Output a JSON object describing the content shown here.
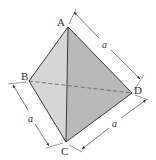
{
  "diagram": {
    "colors": {
      "background": "#ffffff",
      "edge": "#3a3a3a",
      "face_front_left": "#d6d6d6",
      "face_front_right": "#b9b9b9",
      "hidden_edge": "#6a6a6a",
      "dimension_line": "#444444"
    },
    "vertices": {
      "A": {
        "label": "A",
        "x": 68,
        "y": 27
      },
      "B": {
        "label": "B",
        "x": 29,
        "y": 81
      },
      "C": {
        "label": "C",
        "x": 66,
        "y": 142
      },
      "D": {
        "label": "D",
        "x": 132,
        "y": 93
      }
    },
    "edges": [
      {
        "from": "A",
        "to": "B",
        "style": "solid"
      },
      {
        "from": "A",
        "to": "C",
        "style": "solid"
      },
      {
        "from": "A",
        "to": "D",
        "style": "solid"
      },
      {
        "from": "B",
        "to": "C",
        "style": "solid"
      },
      {
        "from": "C",
        "to": "D",
        "style": "solid"
      },
      {
        "from": "B",
        "to": "D",
        "style": "dashed"
      }
    ],
    "dimensions": [
      {
        "edge": "AD",
        "label": "a"
      },
      {
        "edge": "BC",
        "label": "a"
      },
      {
        "edge": "CD",
        "label": "a"
      }
    ]
  }
}
